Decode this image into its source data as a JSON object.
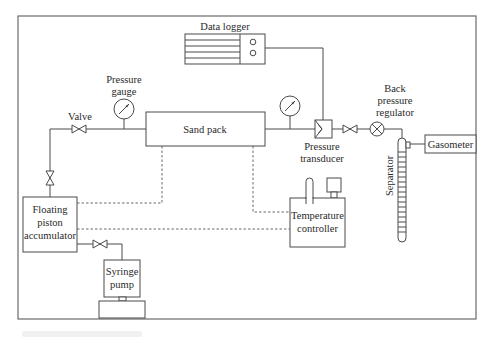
{
  "diagram": {
    "type": "experimental-apparatus-schematic",
    "components": {
      "data_logger": "Data logger",
      "pressure_gauge": "Pressure gauge",
      "valve": "Valve",
      "sand_pack": "Sand pack",
      "pressure_transducer": "Pressure transducer",
      "back_pressure_regulator": "Back pressure regulator",
      "separator": "Separator",
      "gasometer": "Gasometer",
      "floating_piston_accumulator": "Floating piston accumulator",
      "syringe_pump": "Syringe pump",
      "temperature_controller": "Temperature controller"
    },
    "labels": {
      "data_logger": "Data logger",
      "pressure_gauge_l1": "Pressure",
      "pressure_gauge_l2": "gauge",
      "valve": "Valve",
      "sand_pack": "Sand pack",
      "transducer_l1": "Pressure",
      "transducer_l2": "transducer",
      "bpr_l1": "Back",
      "bpr_l2": "pressure",
      "bpr_l3": "regulator",
      "separator": "Separator",
      "gasometer": "Gasometer",
      "fpa_l1": "Floating",
      "fpa_l2": "piston",
      "fpa_l3": "accumulator",
      "syringe_l1": "Syringe",
      "syringe_l2": "pump",
      "temp_l1": "Temperature",
      "temp_l2": "controller"
    },
    "connections": [
      {
        "from": "Syringe pump",
        "to": "Floating piston accumulator",
        "style": "solid",
        "via": "Valve"
      },
      {
        "from": "Floating piston accumulator",
        "to": "Sand pack",
        "style": "solid",
        "via": [
          "Valve",
          "Valve",
          "Pressure gauge"
        ]
      },
      {
        "from": "Sand pack",
        "to": "Pressure transducer",
        "style": "solid",
        "via": "Pressure gauge"
      },
      {
        "from": "Pressure transducer",
        "to": "Data logger",
        "style": "solid"
      },
      {
        "from": "Pressure transducer",
        "to": "Back pressure regulator",
        "style": "solid",
        "via": "Valve"
      },
      {
        "from": "Back pressure regulator",
        "to": "Separator",
        "style": "solid"
      },
      {
        "from": "Separator",
        "to": "Gasometer",
        "style": "solid"
      },
      {
        "from": "Temperature controller",
        "to": "Sand pack",
        "style": "dashed"
      },
      {
        "from": "Temperature controller",
        "to": "Floating piston accumulator",
        "style": "dashed"
      }
    ],
    "colors": {
      "line": "#4a4a4a",
      "frame": "#6a6a6a",
      "background": "#ffffff",
      "text": "#2a2a2a"
    }
  }
}
